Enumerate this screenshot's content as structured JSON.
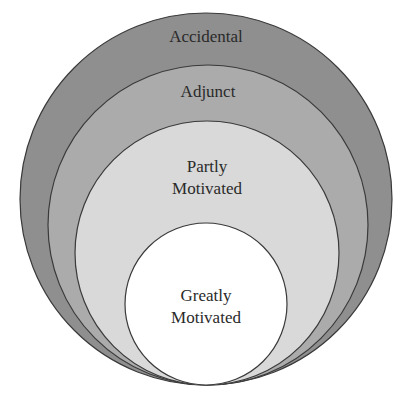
{
  "diagram": {
    "type": "nested-circles",
    "layers": [
      {
        "id": "accidental",
        "label_lines": [
          "Accidental"
        ],
        "fill": "#8f8f8f"
      },
      {
        "id": "adjunct",
        "label_lines": [
          "Adjunct"
        ],
        "fill": "#ababab"
      },
      {
        "id": "partly-motivated",
        "label_lines": [
          "Partly",
          "Motivated"
        ],
        "fill": "#d9d9d9"
      },
      {
        "id": "greatly-motivated",
        "label_lines": [
          "Greatly",
          "Motivated"
        ],
        "fill": "#ffffff"
      }
    ],
    "stroke": "#3a3a3a"
  }
}
